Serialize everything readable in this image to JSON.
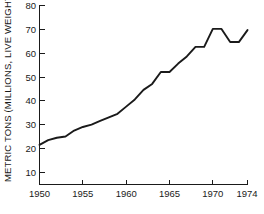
{
  "chart_data": {
    "type": "line",
    "title": "",
    "xlabel": "",
    "ylabel": "METRIC TONS (MILLIONS, LIVE WEIGHT)",
    "xlim": [
      1950,
      1974
    ],
    "ylim": [
      0,
      80
    ],
    "grid": false,
    "legend": "none",
    "x_ticks": [
      1950,
      1955,
      1960,
      1965,
      1970,
      1974
    ],
    "x_tick_labels": [
      "1950",
      "1955",
      "1960",
      "1965",
      "1970",
      "1974"
    ],
    "y_ticks": [
      10,
      20,
      30,
      40,
      50,
      60,
      70,
      80
    ],
    "y_tick_labels": [
      "10",
      "20",
      "30",
      "40",
      "50",
      "60",
      "70",
      "80"
    ],
    "line_color": "#1a1a1a",
    "x": [
      1950,
      1951,
      1952,
      1953,
      1954,
      1955,
      1956,
      1957,
      1958,
      1959,
      1960,
      1961,
      1962,
      1963,
      1964,
      1965,
      1966,
      1967,
      1968,
      1969,
      1970,
      1971,
      1972,
      1973,
      1974
    ],
    "values": [
      21.5,
      23.5,
      24.5,
      25.0,
      27.5,
      29.0,
      30.0,
      31.5,
      33.0,
      34.5,
      37.5,
      40.5,
      44.5,
      47.0,
      52.0,
      52.0,
      55.5,
      58.5,
      62.5,
      62.5,
      70.0,
      70.0,
      64.5,
      64.5,
      69.5
    ],
    "series": [
      {
        "name": "World fish catch",
        "values": [
          21.5,
          23.5,
          24.5,
          25.0,
          27.5,
          29.0,
          30.0,
          31.5,
          33.0,
          34.5,
          37.5,
          40.5,
          44.5,
          47.0,
          52.0,
          52.0,
          55.5,
          58.5,
          62.5,
          62.5,
          70.0,
          70.0,
          64.5,
          64.5,
          69.5
        ]
      }
    ]
  }
}
